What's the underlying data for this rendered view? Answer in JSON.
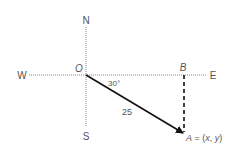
{
  "diagram": {
    "compass": {
      "north": "N",
      "south": "S",
      "east": "E",
      "west": "W"
    },
    "points": {
      "origin": "O",
      "b": "B",
      "a_label_prefix": "A",
      "a_label_eq": " = (",
      "a_x": "x",
      "a_sep": ", ",
      "a_y": "y",
      "a_close": ")"
    },
    "angle_label": "30°",
    "length_label": "25",
    "colors": {
      "axis": "#888888",
      "vector": "#111111",
      "dashed": "#111111",
      "text": "#555555"
    }
  }
}
